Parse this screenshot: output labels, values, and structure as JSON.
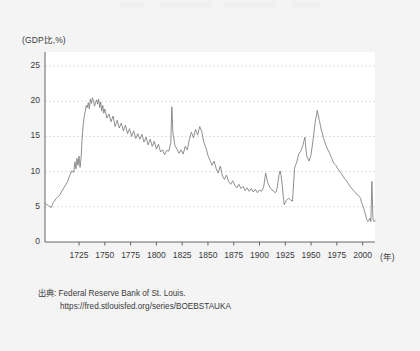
{
  "chart_data": {
    "type": "line",
    "title": "",
    "xlabel": "(年)",
    "ylabel": "(GDP比,%)",
    "xlim": [
      1692,
      2012
    ],
    "ylim": [
      0,
      27
    ],
    "grid": true,
    "legend": false,
    "axis_unit_y": "(GDP比,%)",
    "axis_unit_x": "(年)",
    "y_ticks": [
      "0",
      "5",
      "10",
      "15",
      "20",
      "25"
    ],
    "y_tick_values": [
      0,
      5,
      10,
      15,
      20,
      25
    ],
    "x_ticks": [
      "1725",
      "1750",
      "1775",
      "1800",
      "1825",
      "1850",
      "1875",
      "1900",
      "1925",
      "1950",
      "1975",
      "2000"
    ],
    "x_tick_values": [
      1725,
      1750,
      1775,
      1800,
      1825,
      1850,
      1875,
      1900,
      1925,
      1950,
      1975,
      2000
    ],
    "series_name": "UK government debt to GDP",
    "line_color": "#7c7c7c",
    "x": [
      1692,
      1695,
      1698,
      1700,
      1703,
      1706,
      1709,
      1712,
      1714,
      1716,
      1718,
      1720,
      1721,
      1722,
      1723,
      1724,
      1725,
      1726,
      1727,
      1728,
      1729,
      1730,
      1731,
      1732,
      1733,
      1734,
      1735,
      1736,
      1737,
      1738,
      1739,
      1740,
      1741,
      1742,
      1743,
      1744,
      1745,
      1746,
      1747,
      1748,
      1749,
      1750,
      1752,
      1754,
      1756,
      1758,
      1760,
      1762,
      1764,
      1766,
      1768,
      1770,
      1772,
      1774,
      1776,
      1778,
      1780,
      1782,
      1784,
      1786,
      1788,
      1790,
      1792,
      1794,
      1796,
      1798,
      1800,
      1802,
      1804,
      1806,
      1808,
      1810,
      1812,
      1814,
      1815,
      1816,
      1818,
      1820,
      1822,
      1824,
      1826,
      1828,
      1830,
      1832,
      1834,
      1836,
      1838,
      1840,
      1842,
      1844,
      1846,
      1848,
      1850,
      1852,
      1854,
      1856,
      1858,
      1860,
      1862,
      1864,
      1866,
      1868,
      1870,
      1872,
      1874,
      1876,
      1878,
      1880,
      1882,
      1884,
      1886,
      1888,
      1890,
      1892,
      1894,
      1896,
      1898,
      1900,
      1902,
      1904,
      1906,
      1908,
      1910,
      1912,
      1914,
      1915,
      1916,
      1917,
      1918,
      1919,
      1920,
      1921,
      1922,
      1923,
      1924,
      1926,
      1928,
      1930,
      1932,
      1934,
      1936,
      1938,
      1940,
      1942,
      1944,
      1945,
      1946,
      1948,
      1950,
      1952,
      1954,
      1956,
      1958,
      1960,
      1962,
      1964,
      1966,
      1968,
      1970,
      1972,
      1974,
      1976,
      1978,
      1980,
      1982,
      1984,
      1986,
      1988,
      1990,
      1992,
      1994,
      1996,
      1998,
      1999,
      2000,
      2001,
      2002,
      2003,
      2004,
      2005,
      2006,
      2007,
      2008,
      2009,
      2010,
      2011,
      2012
    ],
    "y": [
      5.5,
      5.2,
      4.9,
      5.6,
      6.2,
      6.6,
      7.4,
      8.1,
      8.6,
      9.5,
      10.1,
      9.9,
      11.4,
      10.4,
      11.9,
      10.9,
      12.2,
      10.6,
      11.9,
      14.8,
      16.6,
      17.8,
      18.6,
      19.4,
      19.1,
      19.8,
      18.9,
      20.3,
      19.7,
      20.5,
      20.1,
      19.3,
      19.8,
      20.2,
      19.6,
      20.3,
      19.1,
      19.9,
      18.6,
      19.4,
      18.3,
      18.9,
      17.6,
      18.2,
      17.1,
      17.9,
      16.4,
      17.3,
      16.2,
      16.9,
      15.8,
      16.6,
      15.4,
      16.1,
      15.0,
      15.8,
      14.7,
      15.4,
      14.6,
      15.3,
      14.2,
      14.9,
      13.8,
      14.6,
      13.6,
      14.3,
      13.2,
      13.9,
      12.8,
      13.1,
      12.4,
      13.0,
      12.9,
      14.1,
      19.2,
      15.6,
      13.7,
      13.2,
      12.6,
      13.1,
      12.5,
      13.6,
      13.1,
      14.6,
      15.6,
      14.8,
      16.0,
      15.2,
      16.4,
      15.7,
      14.2,
      13.4,
      12.3,
      11.6,
      10.9,
      11.5,
      10.4,
      9.8,
      10.8,
      9.4,
      8.9,
      9.5,
      8.6,
      8.2,
      8.7,
      8.1,
      7.7,
      8.2,
      7.6,
      7.9,
      7.3,
      7.7,
      7.2,
      7.6,
      7.1,
      7.5,
      7.0,
      7.4,
      7.2,
      7.8,
      9.8,
      8.4,
      7.8,
      7.4,
      7.2,
      7.0,
      7.1,
      7.6,
      8.6,
      9.6,
      10.1,
      9.4,
      8.1,
      6.5,
      5.3,
      5.9,
      6.2,
      6.0,
      5.8,
      10.5,
      11.3,
      12.5,
      12.9,
      13.7,
      14.9,
      13.2,
      12.1,
      11.5,
      12.4,
      14.6,
      17.0,
      18.7,
      17.3,
      15.9,
      14.8,
      13.9,
      13.2,
      12.6,
      11.9,
      11.2,
      10.9,
      10.4,
      10.0,
      9.6,
      9.1,
      8.8,
      8.3,
      7.9,
      7.5,
      7.2,
      6.8,
      6.6,
      6.2,
      5.6,
      5.2,
      4.8,
      4.3,
      3.7,
      3.2,
      2.9,
      3.0,
      3.4,
      2.9,
      8.6,
      3.3,
      2.9,
      3.0,
      3.3,
      3.7,
      4.3,
      5.0,
      5.8,
      6.6,
      7.8,
      9.4,
      11.6,
      14.2,
      16.8,
      19.4,
      21.6,
      23.9,
      22.6
    ],
    "annotations": [
      {
        "label": "South Sea / early 18C peak",
        "x": 1738,
        "y": 20.5
      },
      {
        "label": "Napoleonic Wars spike",
        "x": 1815,
        "y": 19.2
      },
      {
        "label": "WWI",
        "x": 1918,
        "y": 10.1
      },
      {
        "label": "WWII peak",
        "x": 1945,
        "y": 18.7
      },
      {
        "label": "Late 1990s trough",
        "x": 1997,
        "y": 2.9
      },
      {
        "label": "Post-2008 surge",
        "x": 2011,
        "y": 23.9
      }
    ]
  },
  "source": {
    "line1": "出典: Federal Reserve Bank of St. Louis.",
    "line2": "https://fred.stlouisfed.org/series/BOEBSTAUKA"
  }
}
